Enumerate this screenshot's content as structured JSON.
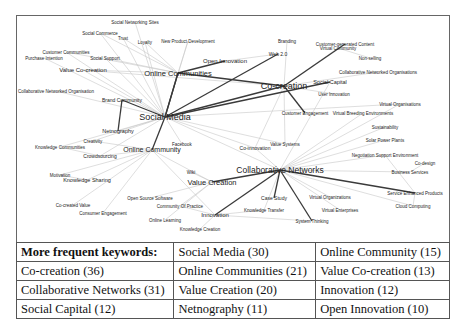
{
  "diagram": {
    "type": "keyword co-occurrence network",
    "nodes": [
      {
        "id": "social_networking_sites",
        "label": "Social Networking Sites",
        "x": 135,
        "y": 22,
        "size": 4.5
      },
      {
        "id": "social_commerce",
        "label": "Social Commerce",
        "x": 100,
        "y": 33,
        "size": 4.5
      },
      {
        "id": "trust",
        "label": "Trust",
        "x": 123,
        "y": 38,
        "size": 4.5
      },
      {
        "id": "loyalty",
        "label": "Loyalty",
        "x": 145,
        "y": 42,
        "size": 4.5
      },
      {
        "id": "new_product_development",
        "label": "New Product Development",
        "x": 188,
        "y": 41,
        "size": 4.5
      },
      {
        "id": "branding",
        "label": "Branding",
        "x": 287,
        "y": 41,
        "size": 4.5
      },
      {
        "id": "customer_generated_content",
        "label": "Customer-generated Content",
        "x": 345,
        "y": 44,
        "size": 4.5
      },
      {
        "id": "virtual_community",
        "label": "Virtual Community",
        "x": 338,
        "y": 48,
        "size": 4.5
      },
      {
        "id": "non_selling",
        "label": "Non-selling",
        "x": 370,
        "y": 58,
        "size": 4.5
      },
      {
        "id": "customer_communities",
        "label": "Customer Communities",
        "x": 66,
        "y": 52,
        "size": 4.5
      },
      {
        "id": "purchase_intention",
        "label": "Purchase Intention",
        "x": 44,
        "y": 58,
        "size": 4.5
      },
      {
        "id": "social_support",
        "label": "Social Support",
        "x": 105,
        "y": 58,
        "size": 4.5
      },
      {
        "id": "web_2_0",
        "label": "Web 2.0",
        "x": 278,
        "y": 54,
        "size": 5
      },
      {
        "id": "open_innovation",
        "label": "Open Innovation",
        "x": 225,
        "y": 61,
        "size": 6
      },
      {
        "id": "value_cocreation",
        "label": "Value Co-creation",
        "x": 83,
        "y": 70,
        "size": 6
      },
      {
        "id": "online_communities",
        "label": "Online Communities",
        "x": 178,
        "y": 73,
        "size": 7.5
      },
      {
        "id": "collab_networked_orgs_right",
        "label": "Collaborative Networked Organisations",
        "x": 378,
        "y": 72,
        "size": 4.5
      },
      {
        "id": "collab_networked_orgs_left",
        "label": "Collaborative Networked Organisation",
        "x": 56,
        "y": 91,
        "size": 4.5
      },
      {
        "id": "cocreation",
        "label": "Co-creation",
        "x": 284,
        "y": 86,
        "size": 9
      },
      {
        "id": "social_capital",
        "label": "Social Capital",
        "x": 330,
        "y": 82,
        "size": 5.5
      },
      {
        "id": "user_innovation",
        "label": "User Innovation",
        "x": 334,
        "y": 94,
        "size": 4.5
      },
      {
        "id": "brand_community",
        "label": "Brand Community",
        "x": 122,
        "y": 100,
        "size": 5
      },
      {
        "id": "virtual_organisations_top",
        "label": "Virtual Organisations",
        "x": 400,
        "y": 104,
        "size": 4.5
      },
      {
        "id": "social_media",
        "label": "Social Media",
        "x": 165,
        "y": 117,
        "size": 9
      },
      {
        "id": "customer_engagement_top",
        "label": "Customer Engagement",
        "x": 305,
        "y": 113,
        "size": 4.5
      },
      {
        "id": "virtual_breeding_environments",
        "label": "Virtual Breeding Environments",
        "x": 363,
        "y": 113,
        "size": 4.5
      },
      {
        "id": "netnography",
        "label": "Netnography",
        "x": 118,
        "y": 131,
        "size": 5.5
      },
      {
        "id": "sustainability",
        "label": "Sustainability",
        "x": 385,
        "y": 127,
        "size": 4.5
      },
      {
        "id": "creativity",
        "label": "Creativity",
        "x": 93,
        "y": 141,
        "size": 4.5
      },
      {
        "id": "knowledge_communities",
        "label": "Knowledge Communities",
        "x": 60,
        "y": 147,
        "size": 4.5
      },
      {
        "id": "value_systems",
        "label": "Value Systems",
        "x": 285,
        "y": 144,
        "size": 4.5
      },
      {
        "id": "facebook",
        "label": "Facebook",
        "x": 182,
        "y": 144,
        "size": 4.5
      },
      {
        "id": "solar_power_plants",
        "label": "Solar Power Plants",
        "x": 385,
        "y": 140,
        "size": 4.5
      },
      {
        "id": "co_innovation",
        "label": "Co-innovation",
        "x": 255,
        "y": 148,
        "size": 5
      },
      {
        "id": "online_community",
        "label": "Online Community",
        "x": 152,
        "y": 150,
        "size": 7
      },
      {
        "id": "crowdsourcing",
        "label": "Crowdsourcing",
        "x": 100,
        "y": 156,
        "size": 5
      },
      {
        "id": "negotiation_support_environment",
        "label": "Negotiation Support Environment",
        "x": 385,
        "y": 155,
        "size": 4.5
      },
      {
        "id": "codesign",
        "label": "Co-design",
        "x": 425,
        "y": 163,
        "size": 4.5
      },
      {
        "id": "collaborative_networks",
        "label": "Collaborative Networks",
        "x": 280,
        "y": 170,
        "size": 8.5
      },
      {
        "id": "business_services",
        "label": "Business Services",
        "x": 410,
        "y": 172,
        "size": 4.5
      },
      {
        "id": "motivation",
        "label": "Motivation",
        "x": 60,
        "y": 175,
        "size": 4.5
      },
      {
        "id": "knowledge_sharing",
        "label": "Knowledge Sharing",
        "x": 87,
        "y": 180,
        "size": 5.5
      },
      {
        "id": "wiki",
        "label": "Wiki",
        "x": 191,
        "y": 172,
        "size": 4.5
      },
      {
        "id": "value_creation",
        "label": "Value Creation",
        "x": 212,
        "y": 182,
        "size": 7.5
      },
      {
        "id": "service_enhanced_products",
        "label": "Service Enhanced Products",
        "x": 415,
        "y": 193,
        "size": 4.5
      },
      {
        "id": "open_source_software",
        "label": "Open Source Software",
        "x": 150,
        "y": 198,
        "size": 4.5
      },
      {
        "id": "case_study",
        "label": "Case Study",
        "x": 274,
        "y": 198,
        "size": 5
      },
      {
        "id": "virtual_organizations_bottom",
        "label": "Virtual Organizations",
        "x": 330,
        "y": 197,
        "size": 4.5
      },
      {
        "id": "co_created_value",
        "label": "Co-created Value",
        "x": 73,
        "y": 205,
        "size": 4.5
      },
      {
        "id": "community_of_practice",
        "label": "Community Of Practice",
        "x": 180,
        "y": 206,
        "size": 4.5
      },
      {
        "id": "cloud_computing",
        "label": "Cloud Computing",
        "x": 413,
        "y": 206,
        "size": 4.5
      },
      {
        "id": "consumer_engagement",
        "label": "Consumer Engagement",
        "x": 103,
        "y": 213,
        "size": 4.5
      },
      {
        "id": "knowledge_transfer",
        "label": "Knowledge Transfer",
        "x": 264,
        "y": 210,
        "size": 4.5
      },
      {
        "id": "virtual_enterprises",
        "label": "Virtual Enterprises",
        "x": 340,
        "y": 210,
        "size": 4.5
      },
      {
        "id": "innovation",
        "label": "Innovation",
        "x": 215,
        "y": 215,
        "size": 6
      },
      {
        "id": "online_learning",
        "label": "Online Learning",
        "x": 165,
        "y": 220,
        "size": 4.5
      },
      {
        "id": "system_thinking",
        "label": "System Thinking",
        "x": 312,
        "y": 221,
        "size": 4.5
      },
      {
        "id": "knowledge_creation",
        "label": "Knowledge Creation",
        "x": 200,
        "y": 229,
        "size": 4.5
      }
    ],
    "strong_edges": [
      [
        "social_media",
        "online_communities"
      ],
      [
        "social_media",
        "cocreation"
      ],
      [
        "social_media",
        "social_capital"
      ],
      [
        "social_media",
        "web_2_0"
      ],
      [
        "online_communities",
        "cocreation"
      ],
      [
        "online_communities",
        "open_innovation"
      ],
      [
        "brand_community",
        "netnography"
      ],
      [
        "social_media",
        "online_community"
      ],
      [
        "collaborative_networks",
        "value_creation"
      ],
      [
        "collaborative_networks",
        "service_enhanced_products"
      ],
      [
        "cocreation",
        "customer_engagement_top"
      ],
      [
        "collaborative_networks",
        "innovation"
      ],
      [
        "collaborative_networks",
        "case_study"
      ],
      [
        "collaborative_networks",
        "system_thinking"
      ],
      [
        "customer_generated_content",
        "cocreation"
      ],
      [
        "online_communities",
        "social_media"
      ],
      [
        "social_media",
        "brand_community"
      ]
    ],
    "weak_edges": [
      [
        "social_media",
        "social_commerce"
      ],
      [
        "social_media",
        "trust"
      ],
      [
        "social_media",
        "loyalty"
      ],
      [
        "social_media",
        "social_networking_sites"
      ],
      [
        "social_media",
        "customer_communities"
      ],
      [
        "social_media",
        "purchase_intention"
      ],
      [
        "social_media",
        "social_support"
      ],
      [
        "social_media",
        "value_cocreation"
      ],
      [
        "social_media",
        "new_product_development"
      ],
      [
        "social_media",
        "netnography"
      ],
      [
        "social_media",
        "creativity"
      ],
      [
        "social_media",
        "knowledge_communities"
      ],
      [
        "social_media",
        "crowdsourcing"
      ],
      [
        "social_media",
        "facebook"
      ],
      [
        "social_media",
        "collab_networked_orgs_left"
      ],
      [
        "social_media",
        "value_systems"
      ],
      [
        "social_media",
        "collaborative_networks"
      ],
      [
        "social_media",
        "virtual_organisations_top"
      ],
      [
        "social_media",
        "co_innovation"
      ],
      [
        "online_communities",
        "social_commerce"
      ],
      [
        "online_communities",
        "customer_communities"
      ],
      [
        "online_communities",
        "value_cocreation"
      ],
      [
        "online_communities",
        "social_support"
      ],
      [
        "online_communities",
        "loyalty"
      ],
      [
        "online_communities",
        "trust"
      ],
      [
        "online_communities",
        "new_product_development"
      ],
      [
        "cocreation",
        "value_cocreation"
      ],
      [
        "cocreation",
        "virtual_community"
      ],
      [
        "cocreation",
        "branding"
      ],
      [
        "cocreation",
        "co_innovation"
      ],
      [
        "cocreation",
        "user_innovation"
      ],
      [
        "cocreation",
        "collab_networked_orgs_right"
      ],
      [
        "cocreation",
        "value_systems"
      ],
      [
        "online_community",
        "knowledge_sharing"
      ],
      [
        "online_community",
        "crowdsourcing"
      ],
      [
        "online_community",
        "motivation"
      ],
      [
        "online_community",
        "co_created_value"
      ],
      [
        "online_community",
        "consumer_engagement"
      ],
      [
        "online_community",
        "creativity"
      ],
      [
        "online_community",
        "innovation"
      ],
      [
        "online_community",
        "value_creation"
      ],
      [
        "collaborative_networks",
        "virtual_organisations_top"
      ],
      [
        "collaborative_networks",
        "virtual_breeding_environments"
      ],
      [
        "collaborative_networks",
        "sustainability"
      ],
      [
        "collaborative_networks",
        "solar_power_plants"
      ],
      [
        "collaborative_networks",
        "negotiation_support_environment"
      ],
      [
        "collaborative_networks",
        "business_services"
      ],
      [
        "collaborative_networks",
        "cloud_computing"
      ],
      [
        "collaborative_networks",
        "knowledge_transfer"
      ],
      [
        "collaborative_networks",
        "virtual_organizations_bottom"
      ],
      [
        "collaborative_networks",
        "virtual_enterprises"
      ],
      [
        "collaborative_networks",
        "co_innovation"
      ],
      [
        "collaborative_networks",
        "social_capital"
      ],
      [
        "value_creation",
        "wiki"
      ],
      [
        "value_creation",
        "open_source_software"
      ],
      [
        "value_creation",
        "community_of_practice"
      ],
      [
        "value_creation",
        "online_learning"
      ],
      [
        "innovation",
        "knowledge_creation"
      ],
      [
        "innovation",
        "knowledge_transfer"
      ],
      [
        "innovation",
        "system_thinking"
      ],
      [
        "innovation",
        "community_of_practice"
      ],
      [
        "business_services",
        "codesign"
      ],
      [
        "service_enhanced_products",
        "cloud_computing"
      ],
      [
        "negotiation_support_environment",
        "service_enhanced_products"
      ],
      [
        "web_2_0",
        "open_innovation"
      ],
      [
        "virtual_community",
        "non_selling"
      ],
      [
        "crowdsourcing",
        "knowledge_communities"
      ],
      [
        "knowledge_sharing",
        "motivation"
      ]
    ]
  },
  "table": {
    "header": "More frequent keywords:",
    "rows": [
      [
        "Social Media (30)",
        "Online Community (15)"
      ],
      [
        "Co-creation (36)",
        "Online Communities (21)",
        "Value Co-creation (13)"
      ],
      [
        "Collaborative Networks (31)",
        "Value Creation (20)",
        "Innovation (12)"
      ],
      [
        "Social Capital (12)",
        "Netnography (11)",
        "Open Innovation (10)"
      ]
    ]
  },
  "colors": {
    "strong_edge": "#3a3a3a",
    "weak_edge": "#c8c8c8",
    "label": "#222222",
    "border": "#555555"
  }
}
